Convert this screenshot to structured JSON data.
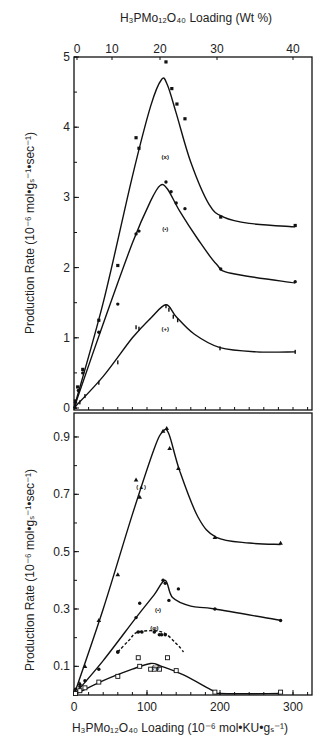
{
  "chart_data": [
    {
      "type": "line",
      "panel": "top",
      "title": "",
      "xlabel": "H3PMo12O40 Loading (10^-6 mol·KU·gs^-1)",
      "x2label": "H3PMo12O40 Loading (Wt %)",
      "ylabel": "Production Rate (10^-6 mol·gs^-1·sec^-1)",
      "ylim": [
        0,
        5
      ],
      "yticks": [
        0,
        1,
        2,
        3,
        4,
        5
      ],
      "ytick_labels": [
        "0",
        "1",
        "2",
        "3",
        "4",
        "5"
      ],
      "x2ticks": [
        {
          "label": "0",
          "px": 77
        },
        {
          "label": "10",
          "px": 112
        },
        {
          "label": "20",
          "px": 160
        },
        {
          "label": "30",
          "px": 217
        },
        {
          "label": "40",
          "px": 293
        }
      ],
      "grid": false,
      "series": [
        {
          "name": "(x)",
          "marker": "x-square",
          "points": [
            [
              2,
              0.1
            ],
            [
              5,
              0.3
            ],
            [
              12,
              0.55
            ],
            [
              34,
              1.25
            ],
            [
              60,
              2.03
            ],
            [
              85,
              3.85
            ],
            [
              89,
              3.7
            ],
            [
              126,
              4.93
            ],
            [
              134,
              4.55
            ],
            [
              141,
              4.33
            ],
            [
              152,
              4.12
            ],
            [
              201,
              2.72
            ],
            [
              303,
              2.6
            ]
          ],
          "curve": [
            [
              0,
              0
            ],
            [
              40,
              1.5
            ],
            [
              80,
              3.3
            ],
            [
              105,
              4.3
            ],
            [
              120,
              4.68
            ],
            [
              128,
              4.6
            ],
            [
              140,
              4.2
            ],
            [
              160,
              3.5
            ],
            [
              185,
              2.9
            ],
            [
              205,
              2.72
            ],
            [
              240,
              2.63
            ],
            [
              303,
              2.58
            ]
          ]
        },
        {
          "name": "(•)",
          "marker": "dot",
          "points": [
            [
              2,
              0.08
            ],
            [
              6,
              0.25
            ],
            [
              12,
              0.5
            ],
            [
              34,
              1.08
            ],
            [
              60,
              1.48
            ],
            [
              85,
              2.48
            ],
            [
              89,
              2.52
            ],
            [
              126,
              3.22
            ],
            [
              133,
              3.08
            ],
            [
              140,
              2.92
            ],
            [
              152,
              2.84
            ],
            [
              201,
              1.98
            ],
            [
              303,
              1.8
            ]
          ],
          "curve": [
            [
              0,
              0
            ],
            [
              40,
              1.2
            ],
            [
              80,
              2.35
            ],
            [
              105,
              2.95
            ],
            [
              118,
              3.17
            ],
            [
              128,
              3.12
            ],
            [
              145,
              2.8
            ],
            [
              170,
              2.4
            ],
            [
              195,
              2.05
            ],
            [
              215,
              1.92
            ],
            [
              303,
              1.78
            ]
          ]
        },
        {
          "name": "(+)",
          "marker": "plus",
          "points": [
            [
              2,
              0.02
            ],
            [
              8,
              0.08
            ],
            [
              15,
              0.17
            ],
            [
              34,
              0.36
            ],
            [
              60,
              0.65
            ],
            [
              85,
              1.15
            ],
            [
              89,
              1.13
            ],
            [
              126,
              1.45
            ],
            [
              130,
              1.4
            ],
            [
              136,
              1.3
            ],
            [
              142,
              1.25
            ],
            [
              200,
              0.85
            ],
            [
              303,
              0.8
            ]
          ],
          "curve": [
            [
              0,
              0
            ],
            [
              40,
              0.45
            ],
            [
              80,
              1.0
            ],
            [
              105,
              1.28
            ],
            [
              126,
              1.47
            ],
            [
              140,
              1.3
            ],
            [
              165,
              1.05
            ],
            [
              200,
              0.86
            ],
            [
              250,
              0.8
            ],
            [
              303,
              0.8
            ]
          ]
        }
      ],
      "annotations": [
        {
          "text": "(x)",
          "x": 125,
          "y": 3.55
        },
        {
          "text": "(•)",
          "x": 125,
          "y": 2.52
        },
        {
          "text": "(+)",
          "x": 125,
          "y": 1.1
        }
      ]
    },
    {
      "type": "line",
      "panel": "bottom",
      "title": "",
      "xlabel": "H3PMo12O40 Loading (10^-6 mol·KU·gs^-1)",
      "ylabel": "Production Rate (10^-6 mol·gs^-1·sec^-1)",
      "xlim": [
        0,
        300
      ],
      "xticks": [
        0,
        100,
        200,
        300
      ],
      "xtick_labels": [
        "0",
        "100",
        "200",
        "300"
      ],
      "ylim": [
        0,
        1.0
      ],
      "yticks": [
        0.1,
        0.3,
        0.5,
        0.7,
        0.9
      ],
      "ytick_labels": [
        "0.1",
        "0.3",
        "0.5",
        "0.7",
        "0.9"
      ],
      "grid": false,
      "series": [
        {
          "name": "(▲)",
          "marker": "triangle",
          "points": [
            [
              2,
              0.01
            ],
            [
              8,
              0.04
            ],
            [
              15,
              0.1
            ],
            [
              34,
              0.26
            ],
            [
              60,
              0.42
            ],
            [
              85,
              0.75
            ],
            [
              90,
              0.69
            ],
            [
              122,
              0.92
            ],
            [
              127,
              0.93
            ],
            [
              131,
              0.86
            ],
            [
              143,
              0.79
            ],
            [
              193,
              0.55
            ],
            [
              283,
              0.53
            ]
          ],
          "curve": [
            [
              0,
              0
            ],
            [
              40,
              0.3
            ],
            [
              80,
              0.63
            ],
            [
              110,
              0.86
            ],
            [
              122,
              0.92
            ],
            [
              130,
              0.91
            ],
            [
              145,
              0.78
            ],
            [
              170,
              0.62
            ],
            [
              195,
              0.55
            ],
            [
              240,
              0.53
            ],
            [
              283,
              0.525
            ]
          ]
        },
        {
          "name": "(•)",
          "marker": "dot",
          "points": [
            [
              2,
              0.02
            ],
            [
              8,
              0.03
            ],
            [
              15,
              0.05
            ],
            [
              34,
              0.09
            ],
            [
              60,
              0.15
            ],
            [
              85,
              0.27
            ],
            [
              90,
              0.32
            ],
            [
              122,
              0.4
            ],
            [
              125,
              0.39
            ],
            [
              130,
              0.33
            ],
            [
              143,
              0.37
            ],
            [
              193,
              0.3
            ],
            [
              283,
              0.26
            ]
          ],
          "curve": [
            [
              0,
              0
            ],
            [
              40,
              0.12
            ],
            [
              85,
              0.27
            ],
            [
              110,
              0.35
            ],
            [
              125,
              0.4
            ],
            [
              135,
              0.34
            ],
            [
              160,
              0.31
            ],
            [
              193,
              0.3
            ],
            [
              283,
              0.26
            ]
          ]
        },
        {
          "name": "(φ)",
          "marker": "circle-bar",
          "points": [
            [
              60,
              0.15
            ],
            [
              88,
              0.22
            ],
            [
              93,
              0.22
            ],
            [
              110,
              0.22
            ],
            [
              117,
              0.21
            ],
            [
              120,
              0.21
            ],
            [
              125,
              0.21
            ]
          ],
          "curve": [
            [
              60,
              0.15
            ],
            [
              75,
              0.19
            ],
            [
              88,
              0.22
            ],
            [
              120,
              0.22
            ],
            [
              140,
              0.18
            ],
            [
              150,
              0.15
            ]
          ],
          "dashed": true
        },
        {
          "name": "(□)",
          "marker": "square",
          "points": [
            [
              2,
              0.005
            ],
            [
              8,
              0.015
            ],
            [
              15,
              0.025
            ],
            [
              34,
              0.045
            ],
            [
              60,
              0.065
            ],
            [
              88,
              0.13
            ],
            [
              90,
              0.1
            ],
            [
              105,
              0.09
            ],
            [
              110,
              0.09
            ],
            [
              117,
              0.09
            ],
            [
              128,
              0.13
            ],
            [
              140,
              0.085
            ],
            [
              193,
              0.01
            ],
            [
              283,
              0.01
            ]
          ],
          "curve": [
            [
              0,
              0
            ],
            [
              40,
              0.05
            ],
            [
              80,
              0.09
            ],
            [
              105,
              0.11
            ],
            [
              120,
              0.1
            ],
            [
              150,
              0.07
            ],
            [
              190,
              0.015
            ],
            [
              200,
              0.005
            ],
            [
              283,
              0.005
            ]
          ]
        }
      ],
      "annotations": [
        {
          "text": "(▲)",
          "x": 92,
          "y": 0.72
        },
        {
          "text": "(•)",
          "x": 115,
          "y": 0.29
        },
        {
          "text": "(φ)",
          "x": 110,
          "y": 0.225
        },
        {
          "text": "(□)",
          "x": 112,
          "y": 0.09
        }
      ]
    }
  ],
  "labels": {
    "top_axis_title": "H₃PMo₁₂O₄₀ Loading (Wt %)",
    "bottom_axis_title": "H₃PMo₁₂O₄₀ Loading (10⁻⁶ mol•KU•gₛ⁻¹)",
    "y_axis_title_top": "Production Rate (10⁻⁶ mol•gₛ⁻¹•sec⁻¹)",
    "y_axis_title_bottom": "Production Rate (10⁻⁶ mol•gₛ⁻¹•sec⁻¹)"
  }
}
